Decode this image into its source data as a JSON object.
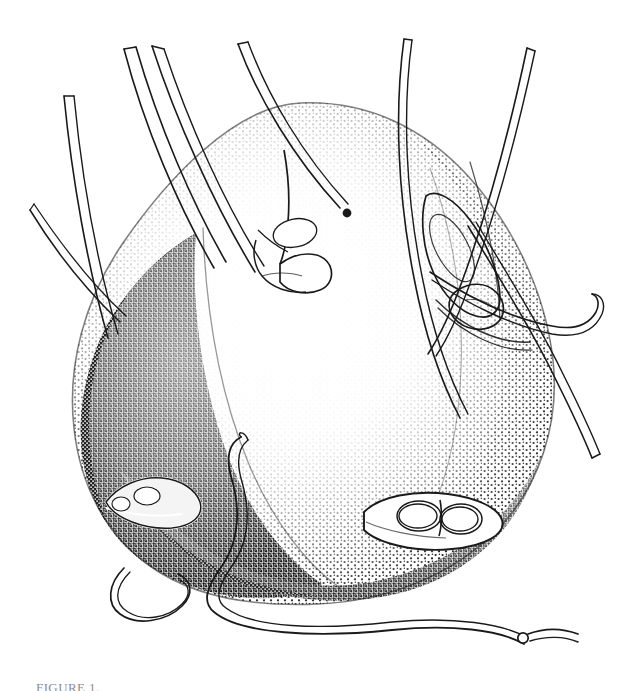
{
  "document": {
    "type": "scientific-illustration-plate",
    "background_color": "#ffffff",
    "ink_color": "#1a1a1a",
    "width": 637,
    "height": 691
  },
  "figure": {
    "technique": "stipple / hatching",
    "caption_partial": "FIGURE 1"
  },
  "body_regions": [
    {
      "name": "idiosoma-dorsal-shield",
      "shading": "light-stipple",
      "note": "large rounded central body, pale toward centre"
    },
    {
      "name": "idiosoma-left-lobe",
      "shading": "dense-stipple",
      "note": "dark shaded left posterior lobe"
    },
    {
      "name": "idiosoma-right-margin",
      "shading": "medium-stipple",
      "note": "graded shading along right edge"
    },
    {
      "name": "ventral-shadow",
      "shading": "heavy-stipple",
      "note": "dark band along lower contour"
    }
  ],
  "features": [
    {
      "name": "left-coxal-plate",
      "label": "coxal plate (left)"
    },
    {
      "name": "right-coxal-plate",
      "label": "coxal plate (right)"
    },
    {
      "name": "upper-coxal-plate",
      "label": "coxal plate (dorsal-anterior)"
    },
    {
      "name": "anterior-gnathosoma",
      "label": "gnathosoma / capitulum"
    }
  ],
  "appendages": [
    {
      "name": "leg-i-left",
      "position": "upper-left",
      "style": "tapered-seta"
    },
    {
      "name": "leg-ii-left",
      "position": "upper-left",
      "style": "tapered-seta"
    },
    {
      "name": "leg-iii-left",
      "position": "left",
      "style": "tapered-seta"
    },
    {
      "name": "leg-iv-left",
      "position": "left-lower",
      "style": "tapered-seta"
    },
    {
      "name": "leg-i-right",
      "position": "upper-right",
      "style": "long-whip-seta"
    },
    {
      "name": "leg-ii-right",
      "position": "right",
      "style": "long-whip-seta"
    },
    {
      "name": "leg-iii-right",
      "position": "right",
      "style": "hooked-seta"
    },
    {
      "name": "leg-iv-right",
      "position": "lower-right",
      "style": "long-curved-seta"
    },
    {
      "name": "ventral-seta-left",
      "position": "bottom-left",
      "style": "looped-seta"
    },
    {
      "name": "ventral-seta-centre",
      "position": "bottom-centre",
      "style": "sinuous-seta"
    },
    {
      "name": "median-dorsal-seta",
      "position": "centre",
      "style": "clubbed-seta"
    }
  ],
  "caption": {
    "text": "FIGURE 1."
  }
}
